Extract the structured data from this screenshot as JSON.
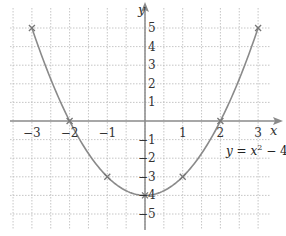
{
  "chart_data": {
    "type": "line",
    "title": "",
    "function_label": "y = x² − 4",
    "function_label_parts": {
      "lhs": "y = x",
      "exp": "2",
      "rhs": " − 4"
    },
    "xlabel": "x",
    "ylabel": "y",
    "xlim": [
      -3,
      3
    ],
    "ylim": [
      -5,
      5
    ],
    "x_ticks": [
      -3,
      -2,
      -1,
      1,
      2,
      3
    ],
    "x_tick_labels": [
      "−3",
      "−2",
      "−1",
      "1",
      "2",
      "3"
    ],
    "y_ticks": [
      5,
      4,
      3,
      2,
      1,
      -1,
      -2,
      -3,
      -4,
      -5
    ],
    "y_tick_labels": [
      "5",
      "4",
      "3",
      "2",
      "1",
      "−1",
      "−2",
      "−3",
      "−4",
      "−5"
    ],
    "grid": true,
    "grid_style": "dotted",
    "series": [
      {
        "name": "y = x² − 4",
        "x": [
          -3,
          -2,
          -1,
          0,
          1,
          2,
          3
        ],
        "y": [
          5,
          0,
          -3,
          -4,
          -3,
          0,
          5
        ],
        "markers": "x",
        "color": "#8a8a8a"
      }
    ]
  },
  "colors": {
    "curve": "#8a8a8a",
    "axis": "#8a8a8a",
    "grid": "#b8b8b8",
    "text": "#333333"
  }
}
